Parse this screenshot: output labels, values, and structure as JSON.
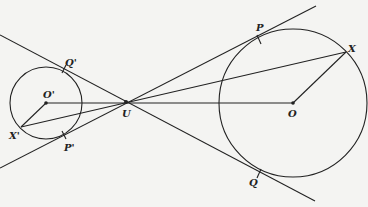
{
  "diagram": {
    "stroke_color": "#222222",
    "background": "#f4f4f2",
    "labels": {
      "P": "P",
      "Q": "Q",
      "X": "X",
      "O": "O",
      "U": "U",
      "P_prime": "P'",
      "Q_prime": "Q'",
      "X_prime": "X'",
      "O_prime": "O'"
    },
    "points": {
      "U": [
        126,
        102
      ],
      "O": [
        293,
        103
      ],
      "O_prime": [
        46,
        103
      ],
      "X": [
        346,
        52
      ],
      "X_prime": [
        21,
        127
      ],
      "P": [
        259,
        40
      ],
      "Q": [
        259,
        174
      ],
      "P_prime": [
        64,
        135
      ],
      "Q_prime": [
        64,
        69
      ]
    },
    "circles": [
      {
        "name": "small-circle",
        "center": [
          46,
          103
        ],
        "r": 36
      },
      {
        "name": "large-circle",
        "center": [
          293,
          103
        ],
        "r": 74
      }
    ]
  }
}
